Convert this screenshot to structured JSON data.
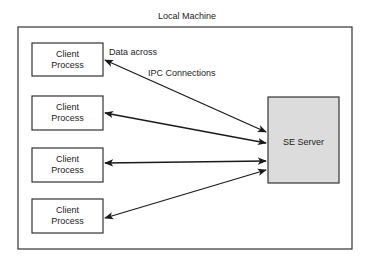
{
  "diagram": {
    "container_label": "Local Machine",
    "server": {
      "label": "SE Server",
      "fill": "#dcdcdc"
    },
    "clients": [
      {
        "line1": "Client",
        "line2": "Process"
      },
      {
        "line1": "Client",
        "line2": "Process"
      },
      {
        "line1": "Client",
        "line2": "Process"
      },
      {
        "line1": "Client",
        "line2": "Process"
      }
    ],
    "annotation": {
      "line1": "Data across",
      "line2": "IPC Connections"
    },
    "connections": [
      {
        "from": "client-1",
        "to": "SE Server",
        "type": "bidirectional"
      },
      {
        "from": "client-2",
        "to": "SE Server",
        "type": "bidirectional"
      },
      {
        "from": "client-3",
        "to": "SE Server",
        "type": "bidirectional"
      },
      {
        "from": "client-4",
        "to": "SE Server",
        "type": "bidirectional"
      }
    ]
  }
}
